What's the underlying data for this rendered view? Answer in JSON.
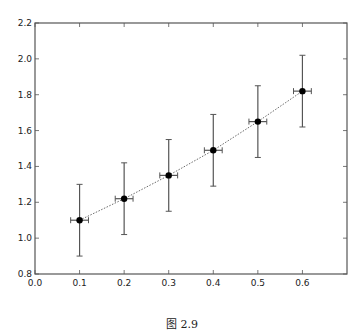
{
  "chart_data": {
    "type": "scatter",
    "title": "",
    "xlabel": "",
    "ylabel": "",
    "xlim": [
      0.0,
      0.7
    ],
    "ylim": [
      0.8,
      2.2
    ],
    "grid": false,
    "legend": null,
    "x_ticks": [
      "0.0",
      "0.1",
      "0.2",
      "0.3",
      "0.4",
      "0.5",
      "0.6"
    ],
    "y_ticks": [
      "0.8",
      "1.0",
      "1.2",
      "1.4",
      "1.6",
      "1.8",
      "2.0",
      "2.2"
    ],
    "series": [
      {
        "name": "data",
        "x": [
          0.1,
          0.2,
          0.3,
          0.4,
          0.5,
          0.6
        ],
        "y": [
          1.1,
          1.22,
          1.35,
          1.49,
          1.65,
          1.82
        ],
        "yerr": [
          0.2,
          0.2,
          0.2,
          0.2,
          0.2,
          0.2
        ],
        "xerr": [
          0.02,
          0.02,
          0.02,
          0.02,
          0.02,
          0.02
        ],
        "marker": "o",
        "line_style": "dotted",
        "color": "#000000"
      }
    ]
  },
  "caption": "图 2.9"
}
